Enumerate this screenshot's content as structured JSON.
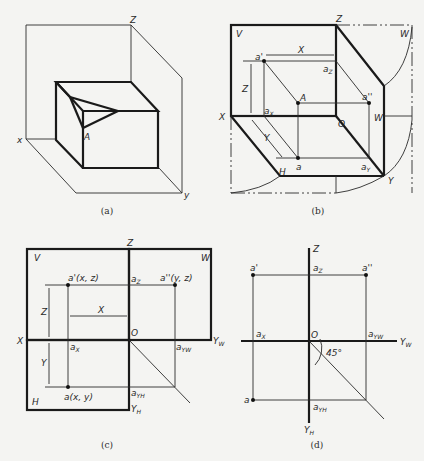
{
  "figure": {
    "panels": [
      {
        "id": "a",
        "caption": "(a)",
        "labels": {
          "z": "Z",
          "x": "x",
          "y": "y",
          "point": "A"
        }
      },
      {
        "id": "b",
        "caption": "(b)",
        "labels": {
          "z": "Z",
          "x": "X",
          "y": "Y",
          "o": "O",
          "v": "V",
          "h": "H",
          "w_top": "W",
          "w_mid": "W",
          "a_front": "a'",
          "a_side": "a''",
          "a_top": "a",
          "big_a": "A",
          "az": "a",
          "az_sub": "Z",
          "ax": "a",
          "ax_sub": "X",
          "ay": "a",
          "ay_sub": "Y",
          "dim_x": "X",
          "dim_y": "Y",
          "dim_z": "Z"
        }
      },
      {
        "id": "c",
        "caption": "(c)",
        "labels": {
          "z": "Z",
          "x": "X",
          "o": "O",
          "v": "V",
          "w": "W",
          "h": "H",
          "yw": "Y",
          "yw_sub": "W",
          "yh": "Y",
          "yh_sub": "H",
          "a_front": "a'(x, z)",
          "a_side": "a''(y, z)",
          "a_top": "a(x, y)",
          "az": "a",
          "az_sub": "Z",
          "ax": "a",
          "ax_sub": "X",
          "ayw": "a",
          "ayw_sub": "YW",
          "ayh": "a",
          "ayh_sub": "YH",
          "dim_x": "X",
          "dim_y": "Y",
          "dim_z": "Z"
        }
      },
      {
        "id": "d",
        "caption": "(d)",
        "labels": {
          "z": "Z",
          "o": "O",
          "yw": "Y",
          "yw_sub": "W",
          "yh": "Y",
          "yh_sub": "H",
          "a_front": "a'",
          "a_side": "a''",
          "a_top": "a",
          "az": "a",
          "az_sub": "Z",
          "ax": "a",
          "ax_sub": "X",
          "ayw": "a",
          "ayw_sub": "YW",
          "ayh": "a",
          "ayh_sub": "YH",
          "angle": "45°"
        }
      }
    ]
  }
}
